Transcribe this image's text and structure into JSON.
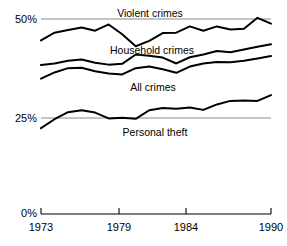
{
  "chart_data": {
    "type": "line",
    "title": "",
    "subtitle": "",
    "xlabel": "",
    "ylabel": "",
    "xlim": [
      1973,
      1990
    ],
    "ylim": [
      0,
      55
    ],
    "grid": true,
    "gridlines_y": [
      25,
      50
    ],
    "legend_position": "inline-labels",
    "x_tick_values": [
      1973,
      1979,
      1984,
      1990
    ],
    "x_tick_labels": [
      "1973",
      "1979",
      "1984",
      "1990"
    ],
    "y_tick_values": [
      0,
      25,
      50
    ],
    "y_tick_labels": [
      "0%",
      "25%",
      "50%"
    ],
    "x": [
      1973,
      1974,
      1975,
      1976,
      1977,
      1978,
      1979,
      1980,
      1981,
      1982,
      1983,
      1984,
      1985,
      1986,
      1987,
      1988,
      1989,
      1990
    ],
    "series": [
      {
        "name": "Violent crimes",
        "label": "Violent crimes",
        "color": "#000000",
        "values": [
          44.5,
          46.5,
          47.2,
          47.8,
          47.0,
          48.6,
          46.1,
          43.0,
          44.4,
          46.4,
          46.5,
          48.1,
          47.0,
          48.1,
          47.3,
          47.5,
          50.3,
          48.8
        ]
      },
      {
        "name": "Household crimes",
        "label": "Household crimes",
        "color": "#000000",
        "values": [
          38.2,
          38.6,
          39.3,
          39.6,
          38.8,
          38.3,
          38.5,
          40.9,
          40.6,
          40.1,
          38.6,
          40.2,
          40.9,
          41.8,
          41.5,
          42.2,
          42.9,
          43.5
        ]
      },
      {
        "name": "All crimes",
        "label": "All crimes",
        "color": "#000000",
        "values": [
          34.7,
          36.3,
          37.4,
          37.5,
          36.6,
          36.0,
          35.8,
          37.4,
          37.8,
          37.1,
          36.2,
          37.8,
          38.6,
          39.0,
          38.9,
          39.3,
          39.9,
          40.5
        ]
      },
      {
        "name": "Personal theft",
        "label": "Personal theft",
        "color": "#000000",
        "values": [
          22.0,
          24.3,
          26.1,
          26.6,
          26.0,
          24.5,
          24.7,
          24.4,
          26.6,
          27.2,
          27.0,
          27.3,
          26.7,
          28.1,
          29.0,
          29.1,
          29.0,
          30.5
        ]
      }
    ]
  },
  "axes": {
    "y_labels": {
      "fifty": "50%",
      "twentyfive": "25%",
      "zero": "0%"
    },
    "x_labels": {
      "start": "1973",
      "second": "1979",
      "third": "1984",
      "end": "1990"
    }
  },
  "series_labels": {
    "violent": "Violent crimes",
    "household": "Household crimes",
    "all": "All crimes",
    "personal": "Personal theft"
  },
  "colors": {
    "line": "#000000",
    "gridline": "#8a8a8a",
    "axis": "#000000",
    "background": "#ffffff"
  }
}
